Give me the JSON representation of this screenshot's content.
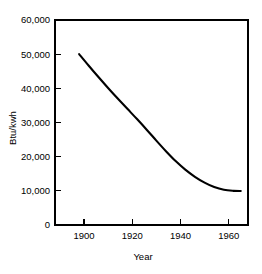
{
  "chart_data": {
    "type": "line",
    "title": "",
    "xlabel": "Year",
    "ylabel": "Btu/kwh",
    "xlim": [
      1888,
      1968
    ],
    "ylim": [
      0,
      60000
    ],
    "grid": false,
    "legend": false,
    "legend_position": "none",
    "line_color": "#000000",
    "background_color": "#ffffff",
    "x_ticks": [
      1900,
      1920,
      1940,
      1960
    ],
    "x_tick_labels": [
      "1900",
      "1920",
      "1940",
      "1960"
    ],
    "y_ticks": [
      0,
      10000,
      20000,
      30000,
      40000,
      50000,
      60000
    ],
    "y_tick_labels": [
      "0",
      "10,000",
      "20,000",
      "30,000",
      "40,000",
      "50,000",
      "60,000"
    ],
    "series": [
      {
        "name": "Heat rate",
        "x": [
          1898,
          1902,
          1906,
          1910,
          1914,
          1918,
          1922,
          1926,
          1930,
          1934,
          1938,
          1942,
          1946,
          1950,
          1954,
          1958,
          1962,
          1965
        ],
        "values": [
          50000,
          46600,
          43300,
          40100,
          37000,
          34000,
          31000,
          27900,
          24700,
          21600,
          18700,
          16200,
          14100,
          12400,
          11100,
          10300,
          10000,
          9950
        ]
      }
    ]
  }
}
